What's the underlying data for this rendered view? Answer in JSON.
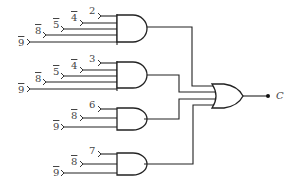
{
  "diagram": {
    "type": "logic-circuit",
    "output": {
      "label": "C"
    },
    "and_gates": [
      {
        "id": "and-1",
        "inputs": [
          {
            "label": "2",
            "negated": false
          },
          {
            "label": "4",
            "negated": true
          },
          {
            "label": "5",
            "negated": true
          },
          {
            "label": "8",
            "negated": true
          },
          {
            "label": "9",
            "negated": true
          }
        ]
      },
      {
        "id": "and-2",
        "inputs": [
          {
            "label": "3",
            "negated": false
          },
          {
            "label": "4",
            "negated": true
          },
          {
            "label": "5",
            "negated": true
          },
          {
            "label": "8",
            "negated": true
          },
          {
            "label": "9",
            "negated": true
          }
        ]
      },
      {
        "id": "and-3",
        "inputs": [
          {
            "label": "6",
            "negated": false
          },
          {
            "label": "8",
            "negated": true
          },
          {
            "label": "9",
            "negated": true
          }
        ]
      },
      {
        "id": "and-4",
        "inputs": [
          {
            "label": "7",
            "negated": false
          },
          {
            "label": "8",
            "negated": true
          },
          {
            "label": "9",
            "negated": true
          }
        ]
      }
    ],
    "or_gate": {
      "id": "or-1",
      "inputs": [
        "and-1",
        "and-2",
        "and-3",
        "and-4"
      ],
      "output": "C"
    }
  }
}
